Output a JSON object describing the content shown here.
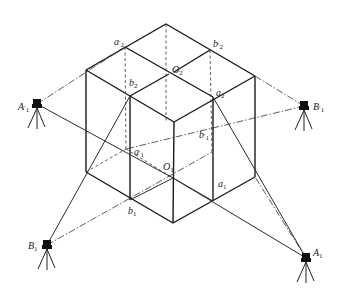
{
  "figure": {
    "labels": {
      "a2_prime": {
        "base": "a",
        "sub": "2",
        "prime": "′"
      },
      "b2_prime": {
        "base": "b",
        "sub": "2",
        "prime": "′"
      },
      "O2": {
        "base": "O",
        "sub": "2",
        "prime": ""
      },
      "b2": {
        "base": "b",
        "sub": "2",
        "prime": ""
      },
      "a2": {
        "base": "a",
        "sub": "2",
        "prime": ""
      },
      "b1_prime": {
        "base": "b",
        "sub": "1",
        "prime": "′"
      },
      "a1_prime": {
        "base": "a",
        "sub": "1",
        "prime": "′"
      },
      "O1": {
        "base": "O",
        "sub": "1",
        "prime": ""
      },
      "a1": {
        "base": "a",
        "sub": "1",
        "prime": ""
      },
      "b1": {
        "base": "b",
        "sub": "1",
        "prime": ""
      },
      "A1_prime": {
        "base": "A",
        "sub": "1",
        "prime": "′"
      },
      "B1_prime": {
        "base": "B",
        "sub": "1",
        "prime": "′"
      },
      "B1": {
        "base": "B",
        "sub": "1",
        "prime": ""
      },
      "A1": {
        "base": "A",
        "sub": "1",
        "prime": ""
      }
    },
    "instruments": [
      {
        "name": "A1_prime",
        "x": 37,
        "y": 104
      },
      {
        "name": "B1_prime",
        "x": 304,
        "y": 106
      },
      {
        "name": "B1",
        "x": 47,
        "y": 245
      },
      {
        "name": "A1",
        "x": 306,
        "y": 258
      }
    ],
    "colors": {
      "line": "#1a1a1a",
      "background": "#ffffff"
    }
  }
}
